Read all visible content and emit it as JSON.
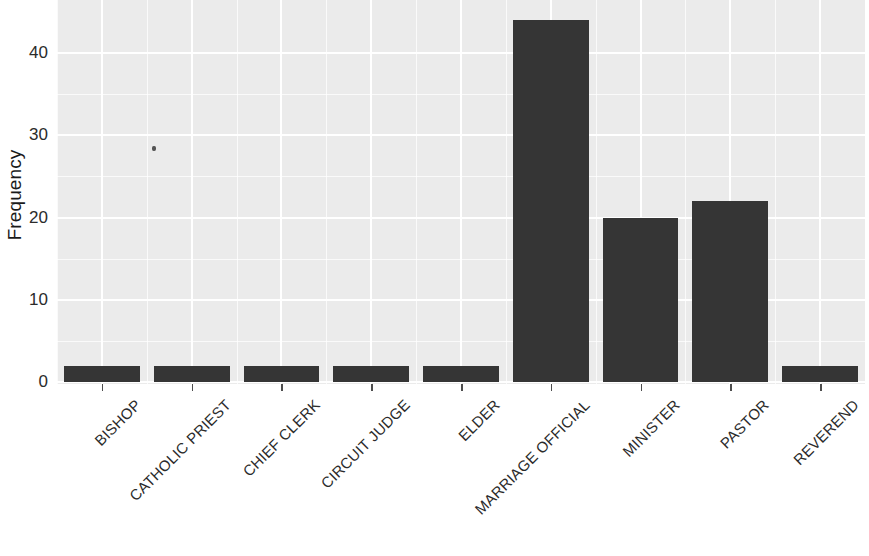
{
  "chart_data": {
    "type": "bar",
    "title": "",
    "subtitle": "",
    "xlabel": "",
    "ylabel": "Frequency",
    "categories": [
      "BISHOP",
      "CATHOLIC PRIEST",
      "CHIEF CLERK",
      "CIRCUIT JUDGE",
      "ELDER",
      "MARRIAGE OFFICIAL",
      "MINISTER",
      "PASTOR",
      "REVEREND"
    ],
    "values": [
      2,
      2,
      2,
      2,
      2,
      44,
      20,
      22,
      2
    ],
    "ylim": [
      0,
      44
    ],
    "y_ticks": [
      0,
      10,
      20,
      30,
      40
    ],
    "y_tick_labels": [
      "0",
      "10",
      "20",
      "30",
      "40"
    ],
    "grid": true,
    "legend": "none",
    "bar_color": "#353535",
    "panel_background": "#ebebeb",
    "grid_color": "#ffffff",
    "axis_text_color": "#2b2b2b"
  },
  "axes": {
    "y_title": "Frequency"
  }
}
